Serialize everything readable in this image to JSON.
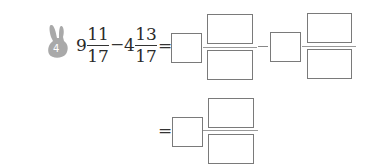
{
  "problem": {
    "number": "4",
    "badge_color": "#a9a9a9",
    "expression": {
      "term1": {
        "whole": "9",
        "numerator": "11",
        "denominator": "17"
      },
      "operator": "−",
      "term2": {
        "whole": "4",
        "numerator": "13",
        "denominator": "17"
      },
      "equals": "="
    },
    "step1": {
      "equals": "=",
      "minus": "−",
      "answer_boxes": [
        "whole-1",
        "numerator-1",
        "denominator-1",
        "whole-2",
        "numerator-2",
        "denominator-2"
      ]
    },
    "step2": {
      "equals": "=",
      "answer_boxes": [
        "whole",
        "numerator",
        "denominator"
      ]
    }
  }
}
